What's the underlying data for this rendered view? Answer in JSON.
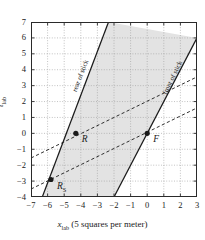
{
  "chart_data": {
    "type": "line",
    "title": "",
    "xlabel": "x_lab (5 squares per meter)",
    "ylabel": "t_lab",
    "xlim": [
      -7,
      3
    ],
    "ylim": [
      -4,
      7
    ],
    "grid": true,
    "x_ticks": [
      "-7",
      "-6",
      "-5",
      "-4",
      "-3",
      "-2",
      "-1",
      "0",
      "1",
      "2",
      "3"
    ],
    "y_ticks": [
      "-4",
      "-3",
      "-2",
      "-1",
      "0",
      "1",
      "2",
      "3",
      "4",
      "5",
      "6",
      "7"
    ],
    "legend_position": "inline-annotations",
    "series": [
      {
        "name": "rear of stick",
        "style": "solid",
        "kind": "worldline",
        "points": [
          [
            -6.32,
            -4
          ],
          [
            -2.33,
            7
          ]
        ]
      },
      {
        "name": "front of stick",
        "style": "solid",
        "kind": "worldline",
        "points": [
          [
            -2.0,
            -4
          ],
          [
            3.0,
            6
          ]
        ]
      },
      {
        "name": "line-of-simultaneity-upper",
        "style": "dashed",
        "kind": "simultaneity",
        "points": [
          [
            -7.0,
            -1.55
          ],
          [
            3.0,
            3.55
          ]
        ]
      },
      {
        "name": "line-of-simultaneity-lower",
        "style": "dashed",
        "kind": "simultaneity",
        "points": [
          [
            -7.0,
            -3.5
          ],
          [
            3.0,
            1.6
          ]
        ]
      }
    ],
    "shaded_region": {
      "name": "stick-worldsheet",
      "color": "#e3e3e3",
      "between": [
        "rear of stick",
        "front of stick"
      ]
    },
    "points": [
      {
        "label": "R",
        "x": -4.3,
        "y": 0.0,
        "label_dx": 6,
        "label_dy": 2
      },
      {
        "label": "F",
        "x": 0.0,
        "y": 0.0,
        "label_dx": 6,
        "label_dy": 2
      },
      {
        "label": "R",
        "sub": "S",
        "x": -5.8,
        "y": -2.9,
        "label_dx": 6,
        "label_dy": 2
      }
    ],
    "annotations": [
      {
        "text": "rear of stick",
        "x": -4.0,
        "y": 3.6,
        "rotation": -69
      },
      {
        "text": "front of stick",
        "x": 1.55,
        "y": 3.5,
        "rotation": -64
      }
    ]
  },
  "axes": {
    "x_label_symbol": "x",
    "x_label_sub": "lab",
    "x_label_rest": " (5 squares per meter)",
    "y_label_symbol": "t",
    "y_label_sub": "lab"
  },
  "colors": {
    "line": "#1a1a1a",
    "grid": "#9a9a9a",
    "frame": "#2a2a2a",
    "shade": "#e3e3e3",
    "background": "#ffffff"
  }
}
